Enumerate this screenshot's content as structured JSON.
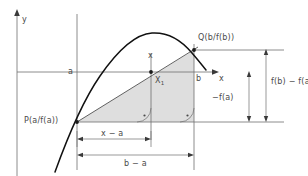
{
  "figure": {
    "kind": "mean-value-theorem-secant-diagram",
    "axes": {
      "y_axis_label": "y",
      "x_axis_label": "x"
    },
    "points": {
      "p_label": "P(a/f(a))",
      "q_label": "Q(b/f(b))",
      "x1_label": "X",
      "x1_subscript": "1"
    },
    "ticks": {
      "a_label": "a",
      "b_label": "b",
      "x_label": "x"
    },
    "dimensions": {
      "horizontal": [
        {
          "name": "x-minus-a",
          "label": "x − a"
        },
        {
          "name": "b-minus-a",
          "label": "b − a"
        }
      ],
      "vertical": [
        {
          "name": "neg-f-a",
          "label": "−f(a)"
        },
        {
          "name": "f-b-minus-f-a",
          "label": "f(b) − f(a)"
        }
      ]
    },
    "colors": {
      "line": "#6e6e6e",
      "curve": "#1a1a1a",
      "fill": "#dedede",
      "text": "#4a4a4a",
      "background": "#ffffff"
    },
    "markers": {
      "right_angle": "right-angle-marker",
      "right_angle_count": 2
    }
  }
}
